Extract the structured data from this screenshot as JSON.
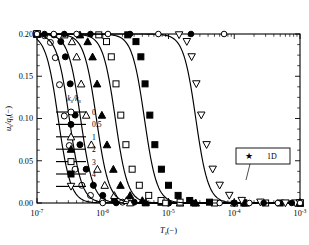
{
  "chart_data": {
    "type": "line",
    "title": "",
    "xlabel": "T_s(−)",
    "ylabel": "u_s/q_s(−)",
    "xscale": "log",
    "xlim": [
      1e-07,
      0.001
    ],
    "ylim": [
      0.0,
      0.2
    ],
    "grid": false,
    "legend_position": "center-left",
    "legend_title": "k_s/k_s",
    "xticks": [
      "10⁻⁷",
      "10⁻⁶",
      "10⁻⁵",
      "10⁻⁴",
      "10⁻³"
    ],
    "xtick_values": [
      1e-07,
      1e-06,
      1e-05,
      0.0001,
      0.001
    ],
    "yticks": [
      "0.00",
      "0.05",
      "0.10",
      "0.15",
      "0.20"
    ],
    "ytick_values": [
      0.0,
      0.05,
      0.1,
      0.15,
      0.2
    ],
    "series": [
      {
        "name": "0",
        "marker": "circle-open",
        "midpoint": 2.1e-07,
        "x": [
          1e-07,
          1.3e-07,
          1.6e-07,
          1.9e-07,
          2.2e-07,
          2.6e-07,
          3.1e-07,
          3.8e-07,
          4.8e-07,
          6.5e-07,
          1e-06,
          2e-06,
          1e-05,
          0.0001,
          0.001
        ],
        "y": [
          0.2,
          0.198,
          0.19,
          0.172,
          0.14,
          0.103,
          0.068,
          0.04,
          0.021,
          0.009,
          0.003,
          0.001,
          0.0,
          0.0,
          0.0
        ]
      },
      {
        "name": "0.5",
        "marker": "circle-filled",
        "midpoint": 3.1e-07,
        "x": [
          1e-07,
          1.8e-07,
          2.3e-07,
          2.7e-07,
          3.2e-07,
          3.8e-07,
          4.5e-07,
          5.6e-07,
          7.2e-07,
          1e-06,
          1.5e-06,
          3e-06,
          1e-05,
          0.0001,
          0.001
        ],
        "y": [
          0.2,
          0.199,
          0.191,
          0.173,
          0.141,
          0.104,
          0.069,
          0.04,
          0.021,
          0.009,
          0.003,
          0.001,
          0.0,
          0.0,
          0.0
        ]
      },
      {
        "name": "1",
        "marker": "triangle-up-open",
        "midpoint": 4.6e-07,
        "x": [
          1e-07,
          2.6e-07,
          3.4e-07,
          4e-07,
          4.7e-07,
          5.6e-07,
          6.7e-07,
          8.3e-07,
          1.07e-06,
          1.5e-06,
          2.3e-06,
          4.5e-06,
          1.5e-05,
          0.0001,
          0.001
        ],
        "y": [
          0.2,
          0.199,
          0.191,
          0.173,
          0.141,
          0.104,
          0.069,
          0.04,
          0.021,
          0.009,
          0.003,
          0.001,
          0.0,
          0.0,
          0.0
        ]
      },
      {
        "name": "2",
        "marker": "triangle-up-filled",
        "midpoint": 8e-07,
        "x": [
          1e-07,
          4.5e-07,
          5.9e-07,
          7e-07,
          8.2e-07,
          9.7e-07,
          1.16e-06,
          1.45e-06,
          1.86e-06,
          2.6e-06,
          4e-06,
          7.8e-06,
          2.6e-05,
          0.00015,
          0.001
        ],
        "y": [
          0.2,
          0.199,
          0.191,
          0.173,
          0.141,
          0.104,
          0.069,
          0.04,
          0.021,
          0.009,
          0.003,
          0.001,
          0.0,
          0.0,
          0.0
        ]
      },
      {
        "name": "3",
        "marker": "square-open",
        "midpoint": 1.55e-06,
        "x": [
          1e-07,
          8.7e-07,
          1.14e-06,
          1.35e-06,
          1.59e-06,
          1.88e-06,
          2.25e-06,
          2.8e-06,
          3.6e-06,
          5e-06,
          7.7e-06,
          1.5e-05,
          5e-05,
          0.0003,
          0.001
        ],
        "y": [
          0.2,
          0.199,
          0.191,
          0.173,
          0.141,
          0.104,
          0.069,
          0.04,
          0.021,
          0.009,
          0.003,
          0.001,
          0.0,
          0.0,
          0.0
        ]
      },
      {
        "name": "4",
        "marker": "square-filled",
        "midpoint": 4.3e-06,
        "x": [
          1e-07,
          2.4e-06,
          3.2e-06,
          3.8e-06,
          4.4e-06,
          5.2e-06,
          6.2e-06,
          7.8e-06,
          1e-05,
          1.4e-05,
          2.1e-05,
          4.2e-05,
          0.00014,
          0.0005,
          0.001
        ],
        "y": [
          0.2,
          0.199,
          0.191,
          0.173,
          0.141,
          0.104,
          0.069,
          0.04,
          0.021,
          0.009,
          0.003,
          0.001,
          0.0,
          0.0,
          0.0
        ]
      },
      {
        "name": "5",
        "marker": "triangle-down-open",
        "midpoint": 2.6e-05,
        "x": [
          1e-07,
          1.45e-05,
          1.9e-05,
          2.25e-05,
          2.65e-05,
          3.15e-05,
          3.8e-05,
          4.7e-05,
          6e-05,
          8.4e-05,
          0.00013,
          0.00025,
          0.0006,
          0.00085,
          0.001
        ],
        "y": [
          0.2,
          0.199,
          0.191,
          0.173,
          0.141,
          0.104,
          0.069,
          0.04,
          0.021,
          0.009,
          0.003,
          0.001,
          0.0,
          0.0,
          0.0
        ]
      }
    ],
    "annotations": [
      {
        "label": "1D",
        "marker": "star",
        "target_x": 0.00017,
        "target_y": 0.052
      }
    ]
  },
  "legend": {
    "header_main": "k",
    "header_sub1": "s",
    "header_div": "/k",
    "header_sub2": "s",
    "items": [
      {
        "label": "0",
        "marker": "circle-open"
      },
      {
        "label": "0.5",
        "marker": "circle-filled"
      },
      {
        "label": "1",
        "marker": "triangle-up-open"
      },
      {
        "label": "2",
        "marker": "triangle-up-filled"
      },
      {
        "label": "3",
        "marker": "square-open"
      },
      {
        "label": "4",
        "marker": "square-filled"
      },
      {
        "label": "5",
        "marker": "triangle-down-open"
      }
    ]
  },
  "axes": {
    "x_title_main": "T",
    "x_title_sub": "s",
    "x_title_unit": "(−)",
    "y_title_num": "u",
    "y_title_num_sub": "s",
    "y_title_den": "/q",
    "y_title_den_sub": "s",
    "y_title_unit": "(−)",
    "xtick_labels": [
      "10",
      "10",
      "10",
      "10",
      "10"
    ],
    "xtick_exponents": [
      "-7",
      "-6",
      "-5",
      "-4",
      "-3"
    ],
    "ytick_labels": [
      "0.00",
      "0.05",
      "0.10",
      "0.15",
      "0.20"
    ]
  },
  "annotation": {
    "label": "1D",
    "marker_glyph": "★"
  }
}
